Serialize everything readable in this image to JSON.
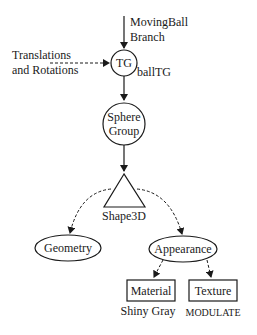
{
  "diagram": {
    "entry_label_line1": "MovingBall",
    "entry_label_line2": "Branch",
    "side_input_line1": "Translations",
    "side_input_line2": "and Rotations",
    "nodes": {
      "tg": {
        "label": "TG",
        "name": "ballTG",
        "shape": "circle"
      },
      "sphere_group": {
        "label_line1": "Sphere",
        "label_line2": "Group",
        "shape": "circle"
      },
      "shape3d": {
        "label": "Shape3D",
        "shape": "triangle"
      },
      "geometry": {
        "label": "Geometry",
        "shape": "ellipse"
      },
      "appearance": {
        "label": "Appearance",
        "shape": "ellipse"
      },
      "material": {
        "label": "Material",
        "note": "Shiny Gray",
        "shape": "rectangle"
      },
      "texture": {
        "label": "Texture",
        "note": "MODULATE",
        "shape": "rectangle"
      }
    },
    "edges": [
      {
        "from": "MovingBall Branch",
        "to": "tg",
        "style": "solid"
      },
      {
        "from": "Translations and Rotations",
        "to": "tg",
        "style": "dashed"
      },
      {
        "from": "tg",
        "to": "sphere_group",
        "style": "solid"
      },
      {
        "from": "sphere_group",
        "to": "shape3d",
        "style": "solid"
      },
      {
        "from": "shape3d",
        "to": "geometry",
        "style": "dashed"
      },
      {
        "from": "shape3d",
        "to": "appearance",
        "style": "dashed"
      },
      {
        "from": "appearance",
        "to": "material",
        "style": "dashed"
      },
      {
        "from": "appearance",
        "to": "texture",
        "style": "dashed"
      }
    ]
  }
}
